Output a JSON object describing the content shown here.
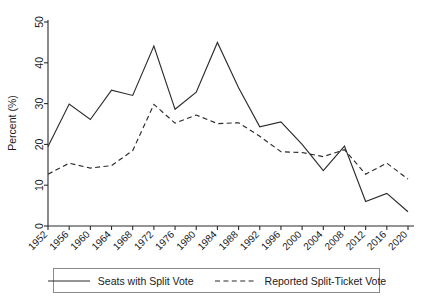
{
  "chart_data": {
    "type": "line",
    "title": "",
    "xlabel": "",
    "ylabel": "Percent (%)",
    "ylim": [
      0,
      50
    ],
    "yticks": [
      0,
      10,
      20,
      30,
      40,
      50
    ],
    "grid": false,
    "legend_position": "bottom",
    "categories": [
      1952,
      1956,
      1960,
      1964,
      1968,
      1972,
      1976,
      1980,
      1984,
      1988,
      1992,
      1996,
      2000,
      2004,
      2008,
      2012,
      2016,
      2020
    ],
    "xtick_labels": [
      "1952",
      "1956",
      "1960",
      "1964",
      "1968",
      "1972",
      "1976",
      "1980",
      "1984",
      "1988",
      "1992",
      "1996",
      "2000",
      "2004",
      "2008",
      "2012",
      "2016",
      "2020"
    ],
    "series": [
      {
        "name": "Seats with Split Vote",
        "style": "solid",
        "color": "#2b2b2b",
        "values": [
          19.5,
          29.9,
          26.1,
          33.3,
          32.0,
          44.1,
          28.6,
          32.8,
          45.0,
          33.9,
          24.3,
          25.5,
          20.0,
          13.6,
          19.6,
          6.0,
          8.0,
          3.5
        ]
      },
      {
        "name": "Reported Split-Ticket Vote",
        "style": "dashed",
        "color": "#2b2b2b",
        "values": [
          12.7,
          15.4,
          14.2,
          14.8,
          18.5,
          29.8,
          25.2,
          27.2,
          25.1,
          25.3,
          22.0,
          18.2,
          18.0,
          17.0,
          18.7,
          12.7,
          15.4,
          11.5
        ]
      }
    ]
  },
  "legend": {
    "entries": [
      {
        "label": "Seats with Split Vote"
      },
      {
        "label": "Reported Split-Ticket Vote"
      }
    ]
  },
  "axes": {
    "y_title": "Percent (%)"
  }
}
